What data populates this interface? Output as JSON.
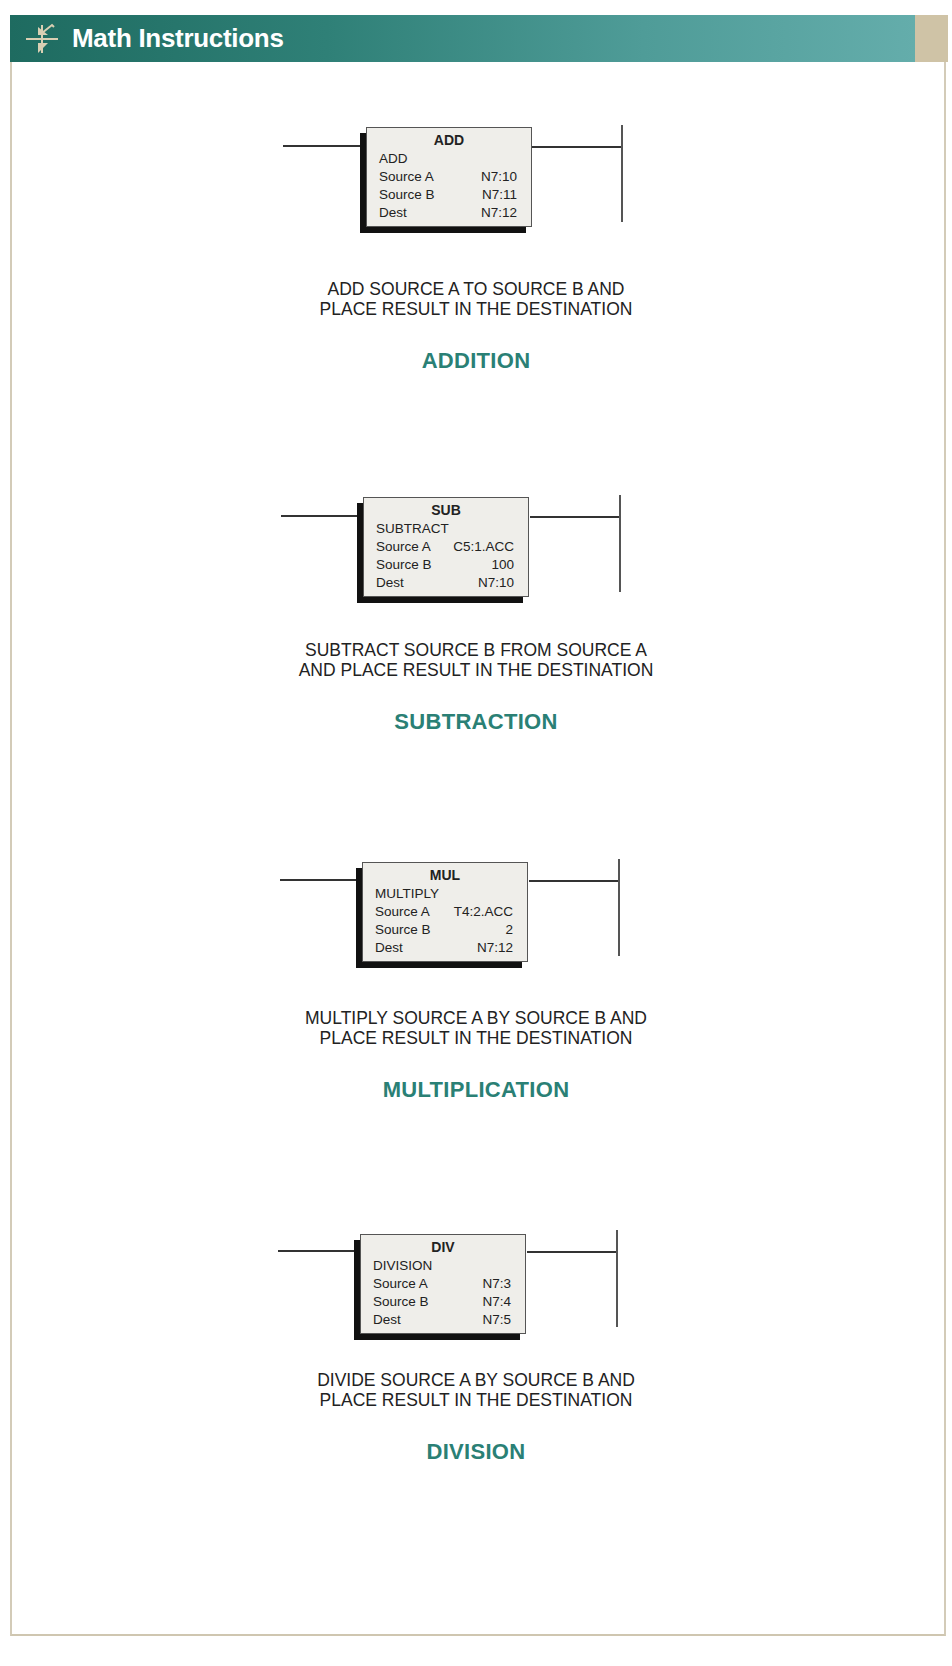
{
  "header": {
    "title": "Math Instructions",
    "icon": "transistor-symbol-icon",
    "colors": {
      "bar_dark": "#1e6b60",
      "bar_light": "#64adab",
      "tab": "#cfc3a6"
    }
  },
  "accent_color": "#2a8075",
  "instructions": [
    {
      "mnemonic": "ADD",
      "long_name": "ADD",
      "rows": [
        {
          "label": "Source A",
          "value": "N7:10"
        },
        {
          "label": "Source B",
          "value": "N7:11"
        },
        {
          "label": "Dest",
          "value": "N7:12"
        }
      ],
      "description": [
        "ADD SOURCE A TO SOURCE B AND",
        "PLACE RESULT IN THE DESTINATION"
      ],
      "title": "ADDITION"
    },
    {
      "mnemonic": "SUB",
      "long_name": "SUBTRACT",
      "rows": [
        {
          "label": "Source A",
          "value": "C5:1.ACC"
        },
        {
          "label": "Source B",
          "value": "100"
        },
        {
          "label": "Dest",
          "value": "N7:10"
        }
      ],
      "description": [
        "SUBTRACT SOURCE B FROM SOURCE A",
        "AND PLACE RESULT IN THE DESTINATION"
      ],
      "title": "SUBTRACTION"
    },
    {
      "mnemonic": "MUL",
      "long_name": "MULTIPLY",
      "rows": [
        {
          "label": "Source A",
          "value": "T4:2.ACC"
        },
        {
          "label": "Source B",
          "value": "2"
        },
        {
          "label": "Dest",
          "value": "N7:12"
        }
      ],
      "description": [
        "MULTIPLY SOURCE A BY SOURCE B AND",
        "PLACE RESULT IN THE DESTINATION"
      ],
      "title": "MULTIPLICATION"
    },
    {
      "mnemonic": "DIV",
      "long_name": "DIVISION",
      "rows": [
        {
          "label": "Source A",
          "value": "N7:3"
        },
        {
          "label": "Source B",
          "value": "N7:4"
        },
        {
          "label": "Dest",
          "value": "N7:5"
        }
      ],
      "description": [
        "DIVIDE SOURCE A BY SOURCE B AND",
        "PLACE RESULT IN THE DESTINATION"
      ],
      "title": "DIVISION"
    }
  ]
}
